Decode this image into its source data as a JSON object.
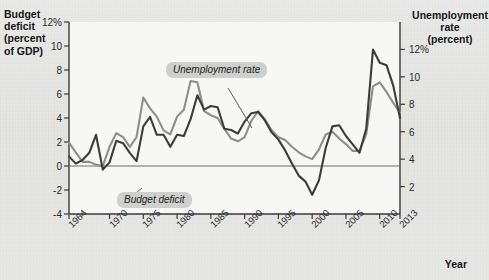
{
  "figure": {
    "background_color": "#e6e6e4",
    "plot_background_color": "#f7f7f6",
    "left_axis_title": "Budget\ndeficit\n(percent\nof GDP)",
    "right_axis_title": "Unemployment\nrate\n(percent)",
    "x_axis_title": "Year"
  },
  "series_labels": {
    "unemployment": "Unemployment rate",
    "deficit": "Budget deficit"
  },
  "chart_data": {
    "type": "line",
    "title": "",
    "xlabel": "Year",
    "ylabel": "Budget deficit (percent of GDP)",
    "y2label": "Unemployment rate (percent)",
    "grid": false,
    "legend": "annotated-inline",
    "xlim": [
      1964,
      2013
    ],
    "ylim": [
      -4,
      12
    ],
    "y2lim": [
      0,
      14
    ],
    "left_ticks": [
      "12%",
      "10",
      "8",
      "6",
      "4",
      "2",
      "0",
      "-2",
      "-4"
    ],
    "left_tick_values": [
      12,
      10,
      8,
      6,
      4,
      2,
      0,
      -2,
      -4
    ],
    "right_ticks": [
      "12%",
      "10",
      "8",
      "6",
      "4",
      "2"
    ],
    "right_tick_values": [
      12,
      10,
      8,
      6,
      4,
      2
    ],
    "x_ticks": [
      "1964",
      "1970",
      "1975",
      "1980",
      "1985",
      "1990",
      "1995",
      "2000",
      "2005",
      "2010",
      "2013"
    ],
    "x_tick_values": [
      1964,
      1970,
      1975,
      1980,
      1985,
      1990,
      1995,
      2000,
      2005,
      2010,
      2013
    ],
    "zero_line": 0,
    "x": [
      1964,
      1965,
      1966,
      1967,
      1968,
      1969,
      1970,
      1971,
      1972,
      1973,
      1974,
      1975,
      1976,
      1977,
      1978,
      1979,
      1980,
      1981,
      1982,
      1983,
      1984,
      1985,
      1986,
      1987,
      1988,
      1989,
      1990,
      1991,
      1992,
      1993,
      1994,
      1995,
      1996,
      1997,
      1998,
      1999,
      2000,
      2001,
      2002,
      2003,
      2004,
      2005,
      2006,
      2007,
      2008,
      2009,
      2010,
      2011,
      2012,
      2013
    ],
    "series": [
      {
        "name": "Budget deficit",
        "axis": "left",
        "unit": "percent of GDP",
        "color": "#3c3c3c",
        "values": [
          0.8,
          0.2,
          0.5,
          1.1,
          2.6,
          -0.3,
          0.3,
          2.1,
          1.9,
          1.1,
          0.4,
          3.3,
          4.1,
          2.6,
          2.6,
          1.6,
          2.6,
          2.5,
          3.9,
          5.9,
          4.7,
          5.0,
          4.9,
          3.1,
          3.0,
          2.7,
          3.7,
          4.4,
          4.5,
          3.8,
          2.8,
          2.2,
          1.3,
          0.2,
          -0.8,
          -1.3,
          -2.4,
          -1.2,
          1.5,
          3.3,
          3.4,
          2.5,
          1.8,
          1.1,
          3.1,
          9.7,
          8.6,
          8.4,
          6.7,
          4.0
        ]
      },
      {
        "name": "Unemployment rate",
        "axis": "right",
        "unit": "percent",
        "color": "#8e8e8e",
        "values": [
          5.2,
          4.5,
          3.8,
          3.8,
          3.6,
          3.5,
          4.9,
          5.9,
          5.6,
          4.9,
          5.6,
          8.5,
          7.7,
          7.1,
          6.1,
          5.8,
          7.1,
          7.6,
          9.7,
          9.6,
          7.5,
          7.2,
          7.0,
          6.2,
          5.5,
          5.3,
          5.6,
          6.8,
          7.5,
          6.9,
          6.1,
          5.6,
          5.4,
          4.9,
          4.5,
          4.2,
          4.0,
          4.7,
          5.8,
          6.0,
          5.5,
          5.1,
          4.6,
          4.6,
          5.8,
          9.3,
          9.6,
          8.9,
          8.1,
          7.4
        ]
      }
    ]
  }
}
